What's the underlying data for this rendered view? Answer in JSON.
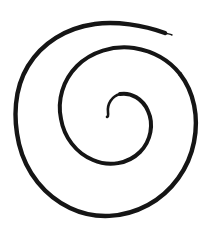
{
  "canvas": {
    "width": 211,
    "height": 231,
    "background_color": "#ffffff",
    "alt_text": "Hand-drawn black spiral"
  },
  "drawing": {
    "name": "spiral",
    "kind": "freehand-line-drawing",
    "ink_color": "#151515",
    "stroke_width_min": 1.0,
    "stroke_width_max": 4.6,
    "turns": 2,
    "winding": "clockwise-inward",
    "center_x": 100,
    "center_y": 122,
    "outer_end_x": 165,
    "outer_end_y": 33,
    "inner_end_x": 107,
    "inner_end_y": 117,
    "bounds": {
      "left": 13,
      "top": 21,
      "right": 196,
      "bottom": 216
    },
    "segments": [
      {
        "name": "outer-revolution",
        "stroke_width": 4.4,
        "d": "M 165 33 C 143 25 116 21 95 24 C 66 28 42 43 28 66 C 14 89 13 118 19 144 C 26 173 45 196 70 208 C 95 220 124 218 148 205 C 172 192 189 168 194 142 C 199 117 194 92 180 74"
      },
      {
        "name": "inner-revolution",
        "stroke_width": 4.0,
        "d": "M 180 74 C 169 60 152 51 134 48 C 113 45 91 52 77 66 C 63 80 57 100 61 119 C 64 137 76 153 93 160 C 109 167 128 164 140 152 C 151 141 154 124 148 111 C 143 99 131 92 120 94"
      },
      {
        "name": "inner-core-tip",
        "stroke_width": 2.6,
        "d": "M 120 94 C 112 96 107 104 108 112 C 108 115 109 116 107 117"
      },
      {
        "name": "outer-end-taper",
        "stroke_width": 1.4,
        "d": "M 165 33 C 168 34 170 34 172 35"
      }
    ]
  }
}
